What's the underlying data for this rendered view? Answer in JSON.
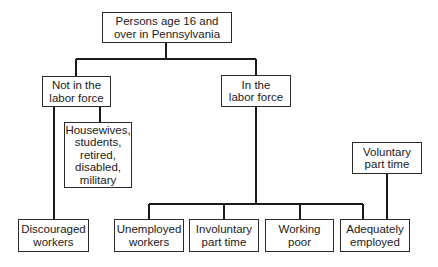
{
  "diagram": {
    "type": "hierarchy",
    "nodes": {
      "root": {
        "label": "Persons age 16 and\nover in Pennsylvania"
      },
      "not_in_labor_force": {
        "label": "Not in the\nlabor force"
      },
      "in_labor_force": {
        "label": "In the\nlabor force"
      },
      "housewives_etc": {
        "label": "Housewives,\nstudents,\nretired,\ndisabled,\nmilitary"
      },
      "discouraged_workers": {
        "label": "Discouraged\nworkers"
      },
      "unemployed_workers": {
        "label": "Unemployed\nworkers"
      },
      "involuntary_part_time": {
        "label": "Involuntary\npart time"
      },
      "working_poor": {
        "label": "Working\npoor"
      },
      "adequately_employed": {
        "label": "Adequately\nemployed"
      },
      "voluntary_part_time": {
        "label": "Voluntary\npart time"
      }
    },
    "edges": [
      [
        "root",
        "not_in_labor_force"
      ],
      [
        "root",
        "in_labor_force"
      ],
      [
        "not_in_labor_force",
        "housewives_etc"
      ],
      [
        "not_in_labor_force",
        "discouraged_workers"
      ],
      [
        "in_labor_force",
        "unemployed_workers"
      ],
      [
        "in_labor_force",
        "involuntary_part_time"
      ],
      [
        "in_labor_force",
        "working_poor"
      ],
      [
        "in_labor_force",
        "adequately_employed"
      ],
      [
        "voluntary_part_time",
        "adequately_employed"
      ]
    ],
    "colors": {
      "line": "#1a1a1a",
      "box_border": "#2a2a2a",
      "background": "#ffffff"
    }
  }
}
